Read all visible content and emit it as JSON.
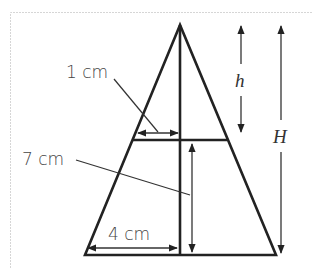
{
  "figure": {
    "labels": {
      "top_width": "1 cm",
      "lower_height": "7 cm",
      "base_half_width": "4 cm",
      "small_height": "h",
      "total_height": "H"
    },
    "colors": {
      "line": "#222222",
      "text": "#444444",
      "frame": "#d6d6d6"
    }
  }
}
